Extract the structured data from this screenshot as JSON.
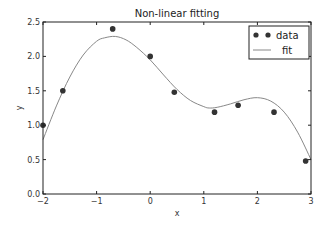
{
  "chart_data": {
    "type": "scatter",
    "title": "Non-linear fitting",
    "xlabel": "x",
    "ylabel": "y",
    "xlim": [
      -2,
      3
    ],
    "ylim": [
      0.0,
      2.5
    ],
    "xticks": [
      "-2",
      "-1",
      "0",
      "1",
      "2",
      "3"
    ],
    "yticks": [
      "0.0",
      "0.5",
      "1.0",
      "1.5",
      "2.0",
      "2.5"
    ],
    "grid": false,
    "legend_position": "upper right",
    "series": [
      {
        "name": "data",
        "kind": "scatter",
        "color": "#333333",
        "x": [
          -2.0,
          -1.63,
          -0.7,
          0.0,
          0.45,
          1.2,
          1.64,
          2.31,
          2.9
        ],
        "y": [
          1.0,
          1.5,
          2.4,
          2.0,
          1.48,
          1.19,
          1.29,
          1.19,
          0.48
        ]
      },
      {
        "name": "fit",
        "kind": "line",
        "color": "#888888",
        "x": [
          -2.0,
          -1.75,
          -1.5,
          -1.25,
          -1.0,
          -0.85,
          -0.65,
          -0.45,
          -0.25,
          0.0,
          0.25,
          0.5,
          0.75,
          1.0,
          1.1,
          1.25,
          1.5,
          1.75,
          2.0,
          2.25,
          2.5,
          2.75,
          3.0
        ],
        "y": [
          0.79,
          1.28,
          1.7,
          2.02,
          2.22,
          2.27,
          2.29,
          2.24,
          2.13,
          1.95,
          1.73,
          1.52,
          1.36,
          1.27,
          1.25,
          1.26,
          1.31,
          1.37,
          1.4,
          1.35,
          1.19,
          0.9,
          0.5
        ]
      }
    ]
  },
  "legend": {
    "items": [
      {
        "label": "data"
      },
      {
        "label": "fit"
      }
    ]
  }
}
